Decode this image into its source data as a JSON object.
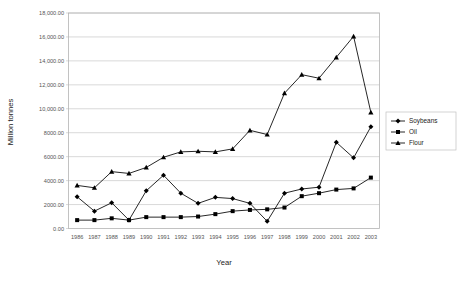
{
  "chart_data": {
    "type": "line",
    "title": "",
    "xlabel": "Year",
    "ylabel": "Million tonnes",
    "grid": true,
    "legend_position": "right",
    "ylim": [
      0,
      18000
    ],
    "ytick_step": 2000,
    "ytick_labels": [
      "0.00",
      "2000.00",
      "4000.00",
      "6000.00",
      "8000.00",
      "10,000.00",
      "12,000.00",
      "14,000.00",
      "16,000.00",
      "18,000.00"
    ],
    "ytick_values": [
      0,
      2000,
      4000,
      6000,
      8000,
      10000,
      12000,
      14000,
      16000,
      18000
    ],
    "categories": [
      "1986",
      "1987",
      "1988",
      "1989",
      "1990",
      "1991",
      "1992",
      "1993",
      "1994",
      "1995",
      "1996",
      "1997",
      "1998",
      "1999",
      "2000",
      "2001",
      "2002",
      "2003"
    ],
    "series": [
      {
        "name": "Soybeans",
        "marker": "diamond",
        "values": [
          2650,
          1450,
          2150,
          700,
          3150,
          4450,
          2950,
          2100,
          2600,
          2500,
          2100,
          600,
          2950,
          3300,
          3450,
          7200,
          5900,
          8500
        ]
      },
      {
        "name": "Oil",
        "marker": "square",
        "values": [
          700,
          700,
          850,
          700,
          950,
          950,
          950,
          1000,
          1200,
          1450,
          1550,
          1600,
          1750,
          2700,
          2950,
          3250,
          3350,
          4250
        ]
      },
      {
        "name": "Flour",
        "marker": "triangle",
        "values": [
          3600,
          3400,
          4750,
          4600,
          5100,
          5950,
          6400,
          6450,
          6400,
          6650,
          8200,
          7850,
          11300,
          12850,
          12550,
          14300,
          16050,
          9700
        ]
      }
    ]
  },
  "legend": {
    "items": [
      {
        "label": "Soybeans"
      },
      {
        "label": "Oil"
      },
      {
        "label": "Flour"
      }
    ]
  }
}
